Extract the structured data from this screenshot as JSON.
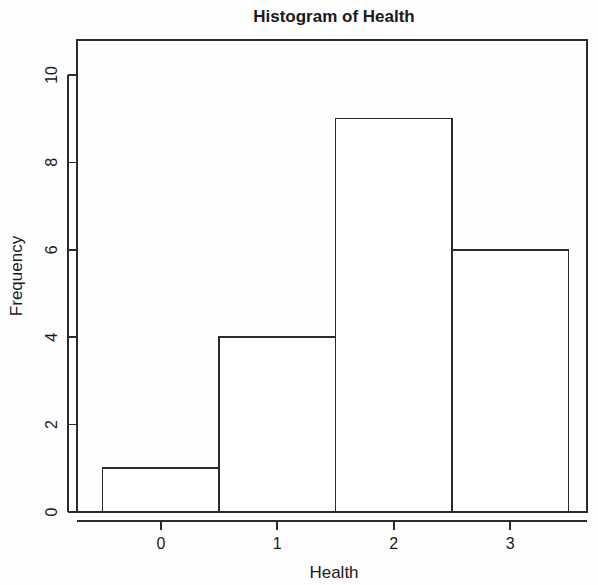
{
  "chart_data": {
    "type": "bar",
    "title": "Histogram of Health",
    "xlabel": "Health",
    "ylabel": "Frequency",
    "categories": [
      "0",
      "1",
      "2",
      "3"
    ],
    "values": [
      1,
      4,
      9,
      6
    ],
    "bin_edges": [
      -0.5,
      0.5,
      1.5,
      2.5,
      3.5
    ],
    "bin_width": 1,
    "xlim": [
      -0.72,
      3.66
    ],
    "ylim": [
      0,
      10.8
    ],
    "xticks": [
      0,
      1,
      2,
      3
    ],
    "xtick_labels": [
      "0",
      "1",
      "2",
      "3"
    ],
    "yticks": [
      0,
      2,
      4,
      6,
      8,
      10
    ],
    "ytick_labels": [
      "0",
      "2",
      "4",
      "6",
      "8",
      "10"
    ],
    "grid": false,
    "legend": false,
    "legend_position": "none",
    "bar_fill": "#ffffff",
    "bar_stroke": "#2b2b2b",
    "background": "#fefefe"
  },
  "figure": {
    "width": 598,
    "height": 585
  }
}
